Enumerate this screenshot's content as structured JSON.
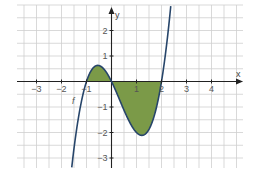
{
  "chart_data": {
    "type": "line",
    "title": "",
    "xlabel": "x",
    "ylabel": "y",
    "function_label": "f",
    "function": "f(x) = x^3 - x^2 - 2x",
    "roots": [
      -1,
      0,
      2
    ],
    "local_max": {
      "x": -0.55,
      "y": 0.63
    },
    "local_min": {
      "x": 1.22,
      "y": -2.11
    },
    "x_ticks": [
      -3,
      -2,
      -1,
      1,
      2,
      3,
      4
    ],
    "y_ticks": [
      -3,
      -2,
      -1,
      1,
      2
    ],
    "x_tick_labels": [
      "−3",
      "−2",
      "−1",
      "1",
      "2",
      "3",
      "4"
    ],
    "y_tick_labels": [
      "−3",
      "−2",
      "−1",
      "1",
      "2"
    ],
    "xlim": [
      -3.8,
      5.3
    ],
    "ylim": [
      -3.4,
      3.0
    ],
    "grid": true,
    "grid_step": 0.5,
    "shaded_region": {
      "between": "f and x-axis",
      "from_x": -1,
      "to_x": 2
    },
    "series": [
      {
        "name": "f",
        "x": [
          -1.65,
          -1.5,
          -1.25,
          -1.0,
          -0.75,
          -0.5,
          -0.25,
          0.0,
          0.25,
          0.5,
          0.75,
          1.0,
          1.25,
          1.5,
          1.75,
          2.0,
          2.25,
          2.5,
          2.68
        ],
        "y": [
          -3.4,
          -2.63,
          -1.27,
          0.0,
          0.52,
          0.63,
          0.42,
          0.0,
          -0.55,
          -1.13,
          -1.64,
          -2.0,
          -2.11,
          -1.88,
          -1.2,
          0.0,
          1.83,
          4.38,
          3.0
        ]
      }
    ],
    "colors": {
      "curve": "#27456a",
      "fill": "#7b9a48",
      "grid": "#cfcfcf",
      "axis": "#222222"
    }
  }
}
